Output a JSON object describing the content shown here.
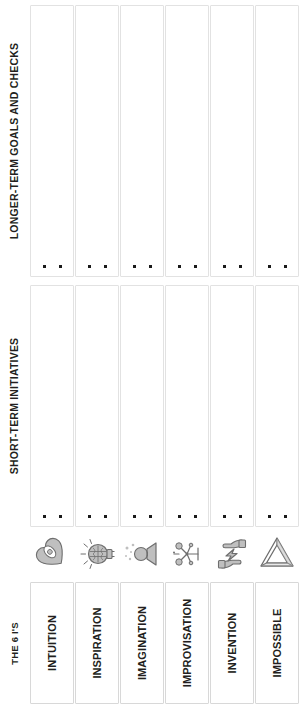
{
  "bands": {
    "longer_term": "LONGER-TERM GOALS AND CHECKS",
    "short_term": "SHORT-TERM INITIATIVES",
    "framework": "THE 6 I'S"
  },
  "colors": {
    "text": "#231f20",
    "cell_border": "#e2e2e2",
    "name_border": "#d8d8d8",
    "marker": "#1a1a1a",
    "icon_fill": "#bfbfbf",
    "icon_stroke": "#6e6e6e",
    "background": "#ffffff"
  },
  "markers_per_cell": 2,
  "columns": [
    {
      "name": "INTUITION",
      "icon": "heart-eye-icon",
      "longer_term_notes": [
        "",
        ""
      ],
      "short_term_notes": [
        "",
        ""
      ]
    },
    {
      "name": "INSPIRATION",
      "icon": "lightbulb-brain-icon",
      "longer_term_notes": [
        "",
        ""
      ],
      "short_term_notes": [
        "",
        ""
      ]
    },
    {
      "name": "IMAGINATION",
      "icon": "glowing-projector-icon",
      "longer_term_notes": [
        "",
        ""
      ],
      "short_term_notes": [
        "",
        ""
      ]
    },
    {
      "name": "IMPROVISATION",
      "icon": "network-nodes-icon",
      "longer_term_notes": [
        "",
        ""
      ],
      "short_term_notes": [
        "",
        ""
      ]
    },
    {
      "name": "INVENTION",
      "icon": "hands-lightning-icon",
      "longer_term_notes": [
        "",
        ""
      ],
      "short_term_notes": [
        "",
        ""
      ]
    },
    {
      "name": "IMPOSSIBLE",
      "icon": "penrose-triangle-icon",
      "longer_term_notes": [
        "",
        ""
      ],
      "short_term_notes": [
        "",
        ""
      ]
    }
  ]
}
